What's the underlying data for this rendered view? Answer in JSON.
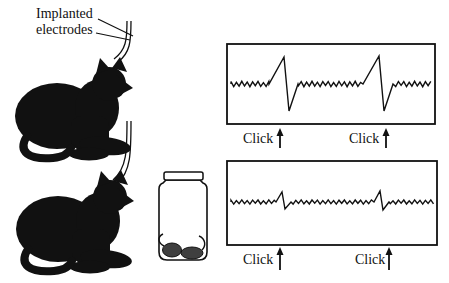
{
  "electrode_label": {
    "line1": "Implanted",
    "line2": "electrodes"
  },
  "click_label": "Click",
  "colors": {
    "ink": "#111111",
    "mouse_gray": "#3f3f3f",
    "background": "#ffffff"
  },
  "panels": {
    "top": {
      "clicks": [
        {
          "x": 280
        },
        {
          "x": 386
        }
      ],
      "trace": {
        "baseline": 84,
        "noise": 2.7,
        "step": 2.7,
        "seed": 1,
        "spikes": [
          {
            "x": 284,
            "up": 27,
            "down": 27,
            "ramp": 15,
            "fall": 5,
            "recover": 9
          },
          {
            "x": 379,
            "up": 28,
            "down": 27,
            "ramp": 16,
            "fall": 5,
            "recover": 9
          }
        ]
      }
    },
    "bottom": {
      "clicks": [
        {
          "x": 280
        },
        {
          "x": 389
        }
      ],
      "trace": {
        "baseline": 202,
        "noise": 2.1,
        "step": 2.7,
        "seed": 7,
        "spikes": [
          {
            "x": 282,
            "up": 10,
            "down": 7,
            "ramp": 6,
            "fall": 3,
            "recover": 6
          },
          {
            "x": 380,
            "up": 11,
            "down": 8,
            "ramp": 6,
            "fall": 3,
            "recover": 6
          }
        ]
      }
    }
  }
}
